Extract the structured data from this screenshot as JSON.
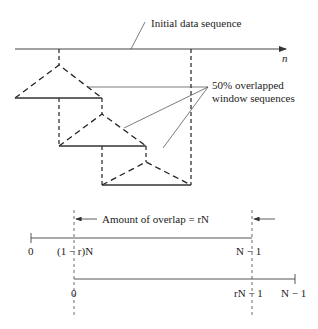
{
  "labels": {
    "initial_sequence": "Initial data sequence",
    "axis_var": "n",
    "windows_line1": "50% overlapped",
    "windows_line2": "window sequences",
    "overlap": "Amount of overlap = rN"
  },
  "axis1": {
    "ticks": [
      "0",
      "(1 − r)N",
      "N − 1"
    ]
  },
  "axis2": {
    "ticks": [
      "0",
      "rN − 1",
      "N − 1"
    ]
  },
  "colors": {
    "line": "#333333",
    "dash": "#222222"
  }
}
